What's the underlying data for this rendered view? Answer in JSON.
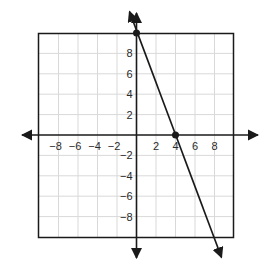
{
  "chart_data": {
    "type": "line",
    "title": "",
    "xlabel": "",
    "ylabel": "",
    "xlim": [
      -10,
      10
    ],
    "ylim": [
      -10,
      10
    ],
    "grid": true,
    "grid_step": 2,
    "x_ticks": [
      "-8",
      "-6",
      "-4",
      "-2",
      "2",
      "4",
      "6",
      "8"
    ],
    "y_ticks": [
      "8",
      "6",
      "4",
      "2",
      "-2",
      "-4",
      "-6",
      "-8"
    ],
    "series": [
      {
        "name": "line",
        "equation": "y = -2.5x + 10",
        "slope": -2.5,
        "y_intercept": 10,
        "x_intercept": 4,
        "points": [
          {
            "x": 0,
            "y": 10
          },
          {
            "x": 4,
            "y": 0
          }
        ],
        "arrows_both_ends": true
      }
    ],
    "colors": {
      "axis": "#1a1a1a",
      "grid": "#d9d9d9",
      "border": "#1a1a1a",
      "line": "#1a1a1a"
    }
  },
  "labels": {
    "x_ticks": [
      "−8",
      "−6",
      "−4",
      "−2",
      "2",
      "4",
      "6",
      "8"
    ],
    "y_ticks": [
      "8",
      "6",
      "4",
      "2",
      "−2",
      "−4",
      "−6",
      "−8"
    ]
  }
}
